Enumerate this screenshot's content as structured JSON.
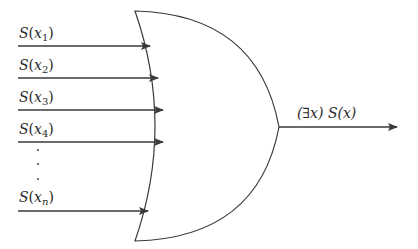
{
  "diagram": {
    "type": "or-gate",
    "stroke_color": "#3a3a3a",
    "inputs": [
      {
        "func": "S",
        "var": "x",
        "sub": "1"
      },
      {
        "func": "S",
        "var": "x",
        "sub": "2"
      },
      {
        "func": "S",
        "var": "x",
        "sub": "3"
      },
      {
        "func": "S",
        "var": "x",
        "sub": "4"
      },
      {
        "func": "S",
        "var": "x",
        "sub": "n"
      }
    ],
    "ellipsis": "⋮",
    "output": {
      "quantifier": "(∃x)",
      "expression": "S(x)",
      "label": "(∃x) S(x)"
    }
  }
}
